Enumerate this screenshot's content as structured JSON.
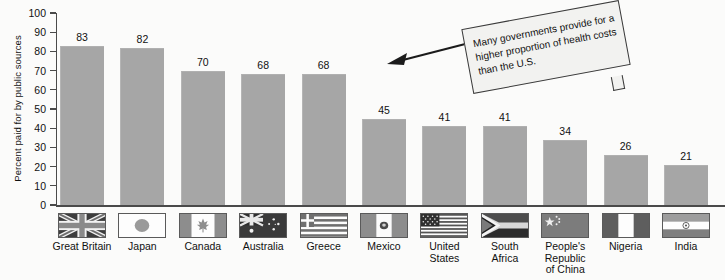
{
  "chart_data": {
    "type": "bar",
    "title": "",
    "xlabel": "",
    "ylabel": "Percent paid for by public sources",
    "ylim": [
      0,
      100
    ],
    "ytick_step": 10,
    "yticks": [
      "100",
      "90",
      "80",
      "70",
      "60",
      "50",
      "40",
      "30",
      "20",
      "10",
      "0"
    ],
    "grid": false,
    "legend": "none",
    "categories": [
      "Great Britain",
      "Japan",
      "Canada",
      "Australia",
      "Greece",
      "Mexico",
      "United States",
      "South Africa",
      "People's Republic of China",
      "Nigeria",
      "India"
    ],
    "values": [
      83,
      82,
      70,
      68,
      68,
      45,
      41,
      41,
      34,
      26,
      21
    ],
    "bar_color": "#a6a6a6",
    "axis_color": "#4a4a4a"
  },
  "categories_display": [
    {
      "name": "Great Britain",
      "lines": [
        "Great Britain"
      ],
      "flag": "flag-united-kingdom",
      "value": 83
    },
    {
      "name": "Japan",
      "lines": [
        "Japan"
      ],
      "flag": "flag-japan",
      "value": 82
    },
    {
      "name": "Canada",
      "lines": [
        "Canada"
      ],
      "flag": "flag-canada",
      "value": 70
    },
    {
      "name": "Australia",
      "lines": [
        "Australia"
      ],
      "flag": "flag-australia",
      "value": 68
    },
    {
      "name": "Greece",
      "lines": [
        "Greece"
      ],
      "flag": "flag-greece",
      "value": 68
    },
    {
      "name": "Mexico",
      "lines": [
        "Mexico"
      ],
      "flag": "flag-mexico",
      "value": 45
    },
    {
      "name": "United States",
      "lines": [
        "United",
        "States"
      ],
      "flag": "flag-united-states",
      "value": 41
    },
    {
      "name": "South Africa",
      "lines": [
        "South",
        "Africa"
      ],
      "flag": "flag-south-africa",
      "value": 41
    },
    {
      "name": "People's Republic of China",
      "lines": [
        "People's",
        "Republic",
        "of China"
      ],
      "flag": "flag-china",
      "value": 34
    },
    {
      "name": "Nigeria",
      "lines": [
        "Nigeria"
      ],
      "flag": "flag-nigeria",
      "value": 26
    },
    {
      "name": "India",
      "lines": [
        "India"
      ],
      "flag": "flag-india",
      "value": 21
    }
  ],
  "annotation": {
    "text": "Many governments provide for a higher proportion of health costs than the U.S.",
    "arrow": "left-arrow-icon"
  }
}
